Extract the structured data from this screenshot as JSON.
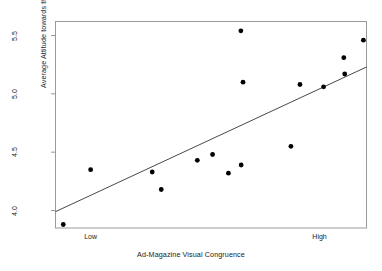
{
  "chart_data": {
    "type": "scatter",
    "title": "",
    "xlabel": "Ad-Magazine Visual Congruence",
    "ylabel": "Average Attitude towards the Product",
    "xlim": [
      0,
      1
    ],
    "ylim": [
      3.85,
      5.62
    ],
    "grid": false,
    "legend": null,
    "x_tick_labels": [
      "Low",
      "High"
    ],
    "x_tick_values": [
      0.113,
      0.849
    ],
    "y_tick_labels": [
      "4.0",
      "4.5",
      "5.0",
      "5.5"
    ],
    "y_tick_values": [
      4.0,
      4.5,
      5.0,
      5.5
    ],
    "point_color": "#000000",
    "line_color": "#333333",
    "frame_color": "#999999",
    "points": [
      {
        "x": 0.025,
        "y": 3.88
      },
      {
        "x": 0.113,
        "y": 4.35
      },
      {
        "x": 0.311,
        "y": 4.33
      },
      {
        "x": 0.34,
        "y": 4.18
      },
      {
        "x": 0.456,
        "y": 4.43
      },
      {
        "x": 0.505,
        "y": 4.48
      },
      {
        "x": 0.556,
        "y": 4.32
      },
      {
        "x": 0.597,
        "y": 4.39
      },
      {
        "x": 0.596,
        "y": 5.54
      },
      {
        "x": 0.603,
        "y": 5.1
      },
      {
        "x": 0.757,
        "y": 4.55
      },
      {
        "x": 0.786,
        "y": 5.08
      },
      {
        "x": 0.862,
        "y": 5.06
      },
      {
        "x": 0.927,
        "y": 5.31
      },
      {
        "x": 0.93,
        "y": 5.17
      },
      {
        "x": 0.99,
        "y": 5.46
      }
    ],
    "trendline": {
      "x_start": 0.0,
      "y_start": 3.99,
      "x_end": 1.0,
      "y_end": 5.23
    }
  },
  "axes": {
    "x_title": "Ad-Magazine Visual Congruence",
    "y_title": "Average Attitude towards the Product",
    "y_ticks": [
      "4.0",
      "4.5",
      "5.0",
      "5.5"
    ],
    "x_ticks": [
      "Low",
      "High"
    ]
  }
}
